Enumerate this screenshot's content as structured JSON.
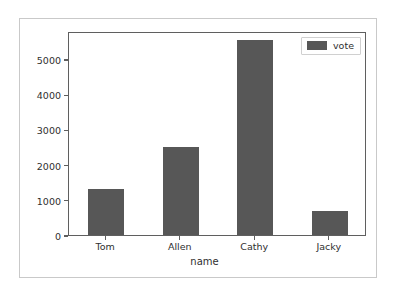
{
  "chart_data": {
    "type": "bar",
    "title": "",
    "xlabel": "name",
    "ylabel": "",
    "categories": [
      "Tom",
      "Allen",
      "Cathy",
      "Jacky"
    ],
    "values": [
      1320,
      2500,
      5550,
      670
    ],
    "series": [
      {
        "name": "vote",
        "values": [
          1320,
          2500,
          5550,
          670
        ]
      }
    ],
    "yticks": [
      0,
      1000,
      2000,
      3000,
      4000,
      5000
    ],
    "ytick_labels": [
      "0",
      "1000",
      "2000",
      "3000",
      "4000",
      "5000"
    ],
    "ylim": [
      0,
      5800
    ],
    "grid": false,
    "legend": {
      "position": "upper right",
      "entries": [
        {
          "label": "vote",
          "color": "#575757"
        }
      ]
    },
    "bar_color": "#575757",
    "axes_color": "#5f5f5f",
    "background": "#ffffff",
    "frame_color": "#c9c9c9"
  }
}
